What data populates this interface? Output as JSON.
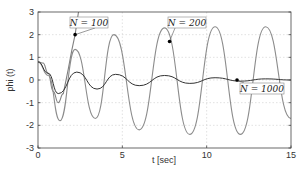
{
  "chart_data": {
    "type": "line",
    "title": "",
    "xlabel": "t [sec]",
    "ylabel": "phi (t)",
    "xlim": [
      0,
      15
    ],
    "ylim": [
      -3,
      3
    ],
    "xticks": [
      0,
      5,
      10,
      15
    ],
    "yticks": [
      -3,
      -2,
      -1,
      0,
      1,
      2,
      3
    ],
    "xtick_labels": [
      "0",
      "5",
      "10",
      "15"
    ],
    "ytick_labels": [
      "-3",
      "-2",
      "-1",
      "0",
      "1",
      "2",
      "3"
    ],
    "grid": true,
    "legend": "none (inline annotations)",
    "series": [
      {
        "name": "N = 100",
        "color": "#808080",
        "x": [
          0,
          0.3,
          0.6,
          0.9,
          1.2,
          1.5,
          1.8,
          2.0,
          2.2,
          2.4
        ],
        "y": [
          0.8,
          0.75,
          0.3,
          -0.5,
          -1.0,
          -0.6,
          0.5,
          1.3,
          2.0,
          3.0
        ],
        "annotation": {
          "label": "N = 100",
          "t": 2.2,
          "phi": 2.0
        }
      },
      {
        "name": "N = 200",
        "color": "#8c8c8c",
        "x": [
          0,
          0.6,
          1.3,
          2.2,
          3.4,
          4.5,
          6.0,
          7.5,
          9.0,
          10.5,
          12.0,
          13.5,
          15.0
        ],
        "y": [
          0.8,
          0.2,
          -1.8,
          1.35,
          -1.7,
          2.0,
          -2.2,
          2.3,
          -2.4,
          2.35,
          -2.4,
          2.35,
          -1.7
        ],
        "annotation": {
          "label": "N = 200",
          "t": 7.8,
          "phi": 1.7
        }
      },
      {
        "name": "N = 1000",
        "color": "#333333",
        "x": [
          0,
          0.6,
          1.2,
          2.3,
          3.5,
          4.6,
          6.0,
          7.5,
          9.0,
          10.5,
          12.0,
          13.5,
          15.0
        ],
        "y": [
          0.8,
          0.3,
          -0.6,
          0.35,
          -0.4,
          0.25,
          -0.25,
          0.2,
          -0.15,
          0.1,
          -0.05,
          0.05,
          0.0
        ],
        "annotation": {
          "label": "N = 1000",
          "t": 11.8,
          "phi": 0.0
        }
      }
    ]
  },
  "axes": {
    "xlabel": "t [sec]",
    "ylabel": "phi (t)"
  },
  "annotations": {
    "n100": "N = 100",
    "n200": "N = 200",
    "n1000": "N = 1000"
  }
}
